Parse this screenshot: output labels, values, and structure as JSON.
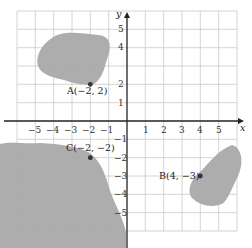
{
  "diagram": {
    "type": "coordinate-plane",
    "axes": {
      "x_label": "x",
      "y_label": "y",
      "x_range": [
        -6,
        6
      ],
      "y_range": [
        -6,
        6
      ]
    },
    "x_ticks": [
      "−5",
      "−4",
      "−3",
      "−2",
      "−1",
      "1",
      "2",
      "3",
      "4",
      "5"
    ],
    "y_ticks_pos": [
      "5",
      "4",
      "2",
      "1"
    ],
    "y_ticks_neg": [
      "−1",
      "−2",
      "−3",
      "−4",
      "−5"
    ],
    "points": [
      {
        "id": "A",
        "label": "A(−2, 2)",
        "x": -2,
        "y": 2
      },
      {
        "id": "B",
        "label": "B(4, −3)",
        "x": 4,
        "y": -3
      },
      {
        "id": "C",
        "label": "C(−2, −2)",
        "x": -2,
        "y": -2
      }
    ],
    "colors": {
      "region": "#a9a9a9",
      "grid": "#c9c9c9",
      "axis": "#222222"
    }
  }
}
